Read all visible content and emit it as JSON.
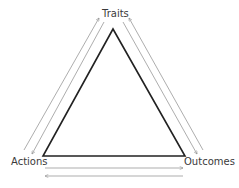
{
  "diagram": {
    "type": "triangle-cycle",
    "nodes": [
      {
        "id": "traits",
        "label": "Traits",
        "position": "top"
      },
      {
        "id": "actions",
        "label": "Actions",
        "position": "bottom-left"
      },
      {
        "id": "outcomes",
        "label": "Outcomes",
        "position": "bottom-right"
      }
    ],
    "edges": [
      {
        "from": "actions",
        "to": "traits",
        "direction": "up",
        "side": "left-outer"
      },
      {
        "from": "traits",
        "to": "actions",
        "direction": "down",
        "side": "left-inner"
      },
      {
        "from": "traits",
        "to": "outcomes",
        "direction": "down",
        "side": "right-inner"
      },
      {
        "from": "outcomes",
        "to": "traits",
        "direction": "up",
        "side": "right-outer"
      },
      {
        "from": "actions",
        "to": "outcomes",
        "direction": "right",
        "side": "bottom-upper"
      },
      {
        "from": "outcomes",
        "to": "actions",
        "direction": "left",
        "side": "bottom-lower"
      }
    ],
    "colors": {
      "triangle": "#222222",
      "arrows": "#8a8a8a",
      "text": "#3a3a3a",
      "background": "#ffffff"
    }
  }
}
